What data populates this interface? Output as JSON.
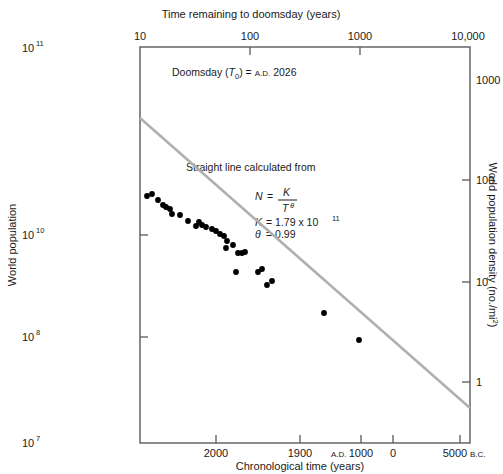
{
  "figure": {
    "background": "#ffffff",
    "line_color": "#b0b0b0",
    "point_color": "#000000",
    "axis_color": "#5a5a5a"
  },
  "top_axis": {
    "title": "Time remaining to doomsday (years)",
    "ticks": [
      "10",
      "100",
      "1000",
      "10,000"
    ]
  },
  "bottom_axis": {
    "title": "Chronological time (years)",
    "ticks": [
      "2000",
      "1900",
      "1000",
      "0",
      "5000"
    ],
    "prefix_ad": "A.D.",
    "suffix_bc": "B.C."
  },
  "left_axis": {
    "title": "World population",
    "ticks": [
      "10",
      "10",
      "10",
      "10"
    ],
    "exponents": [
      "11",
      "10",
      "8",
      "7"
    ]
  },
  "right_axis": {
    "title": "World population density (no./mi",
    "title_exponent": "2",
    "title_close": ")",
    "ticks": [
      "1000",
      "100",
      "10",
      "1"
    ]
  },
  "annotations": {
    "doomsday_label": "Doomsday (",
    "doomsday_var": "T",
    "doomsday_sub": "0",
    "doomsday_mid": ") = ",
    "doomsday_ad": "A.D.",
    "doomsday_year": "2026",
    "fit_caption": "Straight line calculated from",
    "eq_N": "N",
    "eq_eq": "=",
    "eq_K": "K",
    "eq_T": "T",
    "eq_theta": "θ",
    "k_label": "K",
    "k_eq": "= 1.79 x 10",
    "k_exp": "11",
    "theta_label": "θ",
    "theta_eq": "= 0.99"
  },
  "chart_data": {
    "type": "scatter",
    "title": "",
    "xlabel": "Chronological time (years)",
    "ylabel": "World population",
    "x_scale": "log",
    "y_scale": "log",
    "x_top_label": "Time remaining to doomsday (years)",
    "x_top_ticks": [
      10,
      100,
      1000,
      10000
    ],
    "x_bottom_ticks": [
      "A.D. 2000",
      "1900",
      "A.D. 1000",
      "0",
      "5000 B.C."
    ],
    "ylim": [
      10000000.0,
      100000000000.0
    ],
    "y_ticks": [
      100000000000.0,
      10000000000.0,
      100000000.0,
      10000000.0
    ],
    "y2label": "World population density (no./mi2)",
    "y2_ticks": [
      1000,
      100,
      10,
      1
    ],
    "grid": false,
    "legend": "none",
    "fit": {
      "equation": "N = K / T^theta",
      "K": 179000000000.0,
      "theta": 0.99,
      "doomsday_T0_AD": 2026,
      "line_endpoints_px": [
        [
          140,
          118
        ],
        [
          470,
          408
        ]
      ]
    },
    "series": [
      {
        "name": "World population estimates",
        "points_px": [
          [
            147,
            196
          ],
          [
            152,
            194
          ],
          [
            158,
            200
          ],
          [
            163,
            205
          ],
          [
            166,
            207
          ],
          [
            170,
            209
          ],
          [
            172,
            214
          ],
          [
            180,
            215
          ],
          [
            188,
            221
          ],
          [
            196,
            226
          ],
          [
            199,
            222
          ],
          [
            202,
            225
          ],
          [
            206,
            227
          ],
          [
            212,
            229
          ],
          [
            216,
            231
          ],
          [
            220,
            234
          ],
          [
            224,
            236
          ],
          [
            227,
            241
          ],
          [
            226,
            248
          ],
          [
            233,
            245
          ],
          [
            238,
            253
          ],
          [
            242,
            253
          ],
          [
            245,
            252
          ],
          [
            236,
            272
          ],
          [
            258,
            272
          ],
          [
            262,
            269
          ],
          [
            267,
            285
          ],
          [
            272,
            281
          ],
          [
            324,
            313
          ],
          [
            359,
            340
          ]
        ],
        "approx_data": [
          {
            "time_remaining_years": 60,
            "population": 3000000000.0
          },
          {
            "time_remaining_years": 66,
            "population": 3100000000.0
          },
          {
            "time_remaining_years": 76,
            "population": 2600000000.0
          },
          {
            "time_remaining_years": 86,
            "population": 2300000000.0
          },
          {
            "time_remaining_years": 96,
            "population": 2100000000.0
          },
          {
            "time_remaining_years": 106,
            "population": 2000000000.0
          },
          {
            "time_remaining_years": 126,
            "population": 1800000000.0
          },
          {
            "time_remaining_years": 146,
            "population": 1600000000.0
          },
          {
            "time_remaining_years": 176,
            "population": 1300000000.0
          },
          {
            "time_remaining_years": 226,
            "population": 1000000000.0
          },
          {
            "time_remaining_years": 326,
            "population": 700000000.0
          },
          {
            "time_remaining_years": 526,
            "population": 400000000.0
          },
          {
            "time_remaining_years": 1026,
            "population": 200000000.0
          },
          {
            "time_remaining_years": 2026,
            "population": 100000000.0
          },
          {
            "time_remaining_years": 7026,
            "population": 12000000.0
          }
        ]
      }
    ]
  }
}
